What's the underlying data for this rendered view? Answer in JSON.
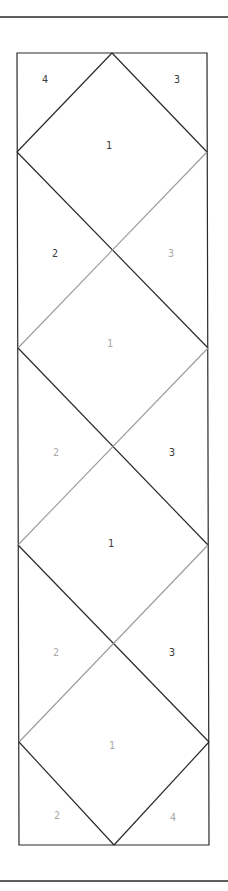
{
  "canvas": {
    "width": 228,
    "height": 891,
    "background": "#ffffff"
  },
  "colors": {
    "dark": "#2a2a2a",
    "light": "#9a9a9a",
    "label_dark": "#3a3a3a",
    "label_light": "#a8a8a8"
  },
  "rules": [
    {
      "name": "top-rule",
      "x1": 0,
      "y1": 17,
      "x2": 228,
      "y2": 17
    },
    {
      "name": "bottom-rule",
      "x1": 0,
      "y1": 881,
      "x2": 228,
      "y2": 881
    }
  ],
  "frame": {
    "top_left": [
      17,
      53
    ],
    "top_right": [
      207,
      53
    ],
    "bottom_right": [
      209,
      845
    ],
    "bottom_left": [
      19,
      845
    ]
  },
  "segments": [
    {
      "x1": 17,
      "y1": 152,
      "x2": 112,
      "y2": 53,
      "tone": "dark"
    },
    {
      "x1": 112,
      "y1": 53,
      "x2": 207,
      "y2": 152,
      "tone": "dark"
    },
    {
      "x1": 17,
      "y1": 152,
      "x2": 208,
      "y2": 348,
      "tone": "dark"
    },
    {
      "x1": 207,
      "y1": 152,
      "x2": 18,
      "y2": 348,
      "tone": "light"
    },
    {
      "x1": 18,
      "y1": 348,
      "x2": 208,
      "y2": 545,
      "tone": "dark"
    },
    {
      "x1": 208,
      "y1": 348,
      "x2": 18,
      "y2": 545,
      "tone": "light"
    },
    {
      "x1": 18,
      "y1": 545,
      "x2": 209,
      "y2": 742,
      "tone": "dark"
    },
    {
      "x1": 208,
      "y1": 545,
      "x2": 19,
      "y2": 742,
      "tone": "light"
    },
    {
      "x1": 19,
      "y1": 742,
      "x2": 114,
      "y2": 845,
      "tone": "dark"
    },
    {
      "x1": 114,
      "y1": 845,
      "x2": 209,
      "y2": 742,
      "tone": "dark"
    }
  ],
  "labels": [
    {
      "text": "4",
      "x": 45,
      "y": 83,
      "tone": "dark"
    },
    {
      "text": "3",
      "x": 177,
      "y": 83,
      "tone": "dark"
    },
    {
      "text": "1",
      "x": 109,
      "y": 149,
      "tone": "dark"
    },
    {
      "text": "2",
      "x": 55,
      "y": 257,
      "tone": "dark"
    },
    {
      "text": "3",
      "x": 171,
      "y": 257,
      "tone": "light"
    },
    {
      "text": "1",
      "x": 110,
      "y": 347,
      "tone": "light"
    },
    {
      "text": "2",
      "x": 56,
      "y": 456,
      "tone": "light"
    },
    {
      "text": "3",
      "x": 172,
      "y": 456,
      "tone": "dark"
    },
    {
      "text": "1",
      "x": 111,
      "y": 547,
      "tone": "dark"
    },
    {
      "text": "2",
      "x": 56,
      "y": 656,
      "tone": "light"
    },
    {
      "text": "3",
      "x": 172,
      "y": 656,
      "tone": "dark"
    },
    {
      "text": "1",
      "x": 112,
      "y": 749,
      "tone": "light"
    },
    {
      "text": "2",
      "x": 57,
      "y": 819,
      "tone": "light"
    },
    {
      "text": "4",
      "x": 173,
      "y": 821,
      "tone": "light"
    }
  ]
}
